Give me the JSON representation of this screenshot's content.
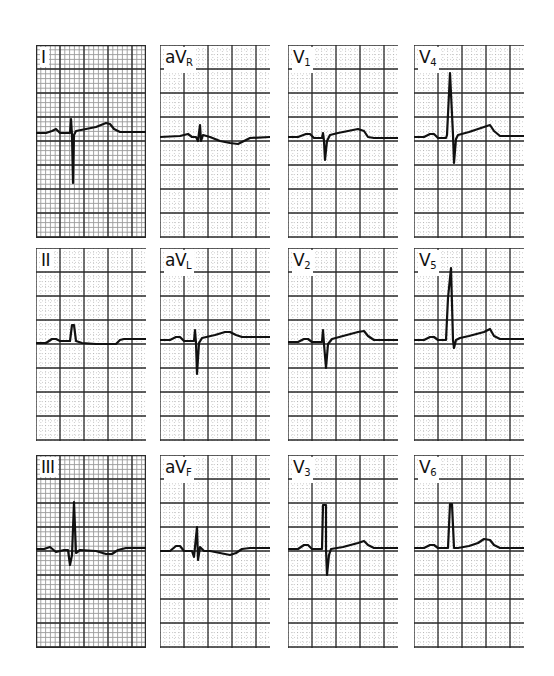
{
  "figure": {
    "colors": {
      "grid_minor": "#9a9a9a",
      "grid_major": "#2a2a2a",
      "trace": "#111111",
      "paper": "#ffffff"
    },
    "leads": [
      {
        "id": "I",
        "label_main": "I",
        "label_sub": "",
        "col": 0,
        "row": 0,
        "dense": true,
        "trace": "0,88 10,88 16,86 20,84 24,88 30,88 34,88 35,74 36,90 37,138 38,90 40,86 50,84 60,82 70,78 74,79 78,84 84,87 110,87"
      },
      {
        "id": "aVR",
        "label_main": "aV",
        "label_sub": "R",
        "col": 1,
        "row": 0,
        "dense": false,
        "trace": "0,92 20,91 28,89 32,92 36,92 38,96 40,80 41,96 43,90 50,92 60,96 70,98 78,99 84,96 90,93 110,92"
      },
      {
        "id": "V1",
        "label_main": "V",
        "label_sub": "1",
        "col": 2,
        "row": 0,
        "dense": false,
        "trace": "0,92 10,92 18,89 22,89 26,93 34,93 35,88 36,96 37,115 39,96 42,90 50,88 60,86 70,84 76,86 80,92 86,93 110,93"
      },
      {
        "id": "V4",
        "label_main": "V",
        "label_sub": "4",
        "col": 3,
        "row": 0,
        "dense": false,
        "trace": "0,92 10,92 16,89 20,89 24,93 32,93 33,90 36,28 39,90 40,118 42,94 44,90 55,87 70,82 76,80 80,86 86,91 110,91"
      },
      {
        "id": "II",
        "label_main": "II",
        "label_sub": "",
        "col": 0,
        "row": 1,
        "dense": false,
        "trace": "0,95 10,95 16,91 20,91 24,93 34,93 36,77 38,77 40,93 46,95 60,96 80,96 84,92 88,91 110,91"
      },
      {
        "id": "aVL",
        "label_main": "aV",
        "label_sub": "L",
        "col": 1,
        "row": 1,
        "dense": false,
        "trace": "0,92 10,92 16,89 20,89 24,93 34,93 35,82 36,95 37,126 39,95 42,90 55,87 65,84 70,84 76,87 82,89 110,89"
      },
      {
        "id": "V2",
        "label_main": "V",
        "label_sub": "2",
        "col": 2,
        "row": 1,
        "dense": false,
        "trace": "0,94 10,94 16,91 20,91 24,94 34,94 35,82 36,96 38,120 40,96 44,91 55,88 70,84 76,83 80,88 86,92 110,92"
      },
      {
        "id": "V5",
        "label_main": "V",
        "label_sub": "5",
        "col": 3,
        "row": 1,
        "dense": false,
        "trace": "0,92 10,92 16,89 20,89 24,92 32,92 34,50 37,20 39,92 40,100 42,92 46,90 55,88 70,84 76,81 80,88 86,91 110,91"
      },
      {
        "id": "III",
        "label_main": "III",
        "label_sub": "",
        "col": 0,
        "row": 2,
        "dense": true,
        "trace": "0,94 8,94 14,92 20,97 28,95 32,95 34,110 36,100 38,47 40,98 44,95 60,96 70,99 76,99 82,95 90,93 110,93"
      },
      {
        "id": "aVF",
        "label_main": "aV",
        "label_sub": "F",
        "col": 1,
        "row": 2,
        "dense": false,
        "trace": "0,96 10,96 16,91 20,91 24,96 32,96 34,102 37,72 38,105 40,92 44,96 50,96 60,98 70,100 76,98 82,94 90,93 110,93"
      },
      {
        "id": "V3",
        "label_main": "V",
        "label_sub": "3",
        "col": 2,
        "row": 2,
        "dense": false,
        "trace": "0,94 10,94 16,90 20,90 24,94 34,94 35,50 38,50 38,94 39,120 41,100 43,94 55,92 70,88 76,86 80,90 86,93 110,93"
      },
      {
        "id": "V6",
        "label_main": "V",
        "label_sub": "6",
        "col": 3,
        "row": 2,
        "dense": false,
        "trace": "0,93 10,93 16,90 20,90 24,93 34,93 36,49 38,49 40,93 44,93 55,91 64,88 70,84 76,85 80,90 86,93 110,93"
      }
    ]
  }
}
